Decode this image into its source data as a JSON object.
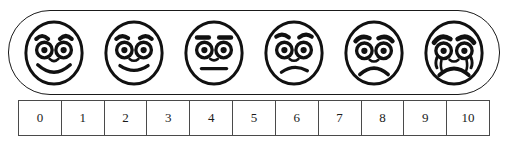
{
  "widget": {
    "name": "faces-pain-rating-scale",
    "line_color": "#1a1a1a",
    "table_line_color": "#4a4a4a",
    "background": "#ffffff"
  },
  "faces": [
    {
      "id": "face-0",
      "expression": "broad-smile",
      "label": "broad smiling face",
      "icon": "smiley-face-happy-icon"
    },
    {
      "id": "face-1",
      "expression": "smile",
      "label": "smiling face",
      "icon": "smiley-face-smile-icon"
    },
    {
      "id": "face-2",
      "expression": "neutral",
      "label": "neutral face",
      "icon": "smiley-face-neutral-icon"
    },
    {
      "id": "face-3",
      "expression": "slight-frown",
      "label": "slightly frowning face",
      "icon": "smiley-face-frown-icon"
    },
    {
      "id": "face-4",
      "expression": "frown",
      "label": "frowning worried face",
      "icon": "smiley-face-sad-icon"
    },
    {
      "id": "face-5",
      "expression": "crying",
      "label": "crying face with tears",
      "icon": "smiley-face-crying-icon"
    }
  ],
  "scale": {
    "values": [
      "0",
      "1",
      "2",
      "3",
      "4",
      "5",
      "6",
      "7",
      "8",
      "9",
      "10"
    ]
  }
}
